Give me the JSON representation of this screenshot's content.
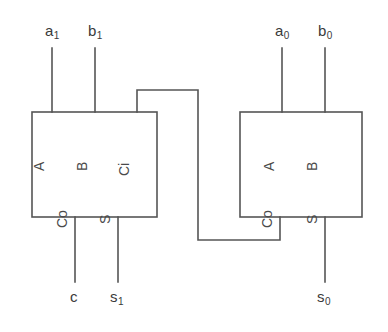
{
  "diagram": {
    "stroke_color": "#555555",
    "text_color": "#3a3a3a",
    "background_color": "#ffffff"
  },
  "blocks": [
    {
      "id": "full-adder-high",
      "pins": {
        "a": "A",
        "b": "B",
        "ci": "Ci",
        "co": "Co",
        "s": "S"
      }
    },
    {
      "id": "full-adder-low",
      "pins": {
        "a": "A",
        "b": "B",
        "co": "Co",
        "s": "S"
      }
    }
  ],
  "signals": {
    "a1": {
      "base": "a",
      "sub": "1"
    },
    "b1": {
      "base": "b",
      "sub": "1"
    },
    "a0": {
      "base": "a",
      "sub": "0"
    },
    "b0": {
      "base": "b",
      "sub": "0"
    },
    "c": {
      "base": "c",
      "sub": ""
    },
    "s1": {
      "base": "s",
      "sub": "1"
    },
    "s0": {
      "base": "s",
      "sub": "0"
    }
  }
}
